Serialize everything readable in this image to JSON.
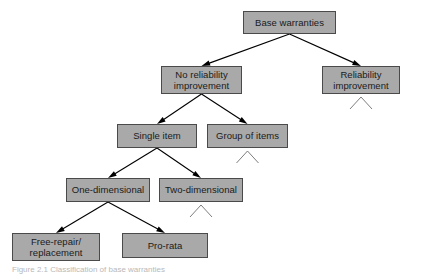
{
  "figure": {
    "type": "tree-diagram",
    "caption": "Figure 2.1  Classification of base warranties",
    "background_color": "#ffffff",
    "box_fill_color": "#a9a9a9",
    "box_border_color": "#4a4a4a",
    "connector_color": "#000000"
  },
  "nodes": [
    {
      "id": "base-warranties",
      "label": "Base warranties",
      "x": 243,
      "y": 11,
      "w": 93,
      "h": 23,
      "continuation": false
    },
    {
      "id": "no-reliability",
      "label": "No reliability\nimprovement",
      "x": 161,
      "y": 66,
      "w": 81,
      "h": 28,
      "continuation": false
    },
    {
      "id": "reliability",
      "label": "Reliability\nimprovement",
      "x": 322,
      "y": 66,
      "w": 78,
      "h": 28,
      "continuation": true
    },
    {
      "id": "single-item",
      "label": "Single item",
      "x": 117,
      "y": 124,
      "w": 80,
      "h": 24,
      "continuation": false
    },
    {
      "id": "group-of-items",
      "label": "Group of items",
      "x": 207,
      "y": 124,
      "w": 81,
      "h": 24,
      "continuation": true
    },
    {
      "id": "one-dimensional",
      "label": "One-dimensional",
      "x": 66,
      "y": 178,
      "w": 84,
      "h": 24,
      "continuation": false
    },
    {
      "id": "two-dimensional",
      "label": "Two-dimensional",
      "x": 159,
      "y": 178,
      "w": 84,
      "h": 24,
      "continuation": true
    },
    {
      "id": "free-repair",
      "label": "Free-repair/\nreplacement",
      "x": 12,
      "y": 233,
      "w": 88,
      "h": 28,
      "continuation": false
    },
    {
      "id": "pro-rata",
      "label": "Pro-rata",
      "x": 122,
      "y": 233,
      "w": 86,
      "h": 25,
      "continuation": false
    }
  ],
  "edges": [
    {
      "id": "edge-base-to-no-reliability",
      "from": "base-warranties",
      "to": "no-reliability"
    },
    {
      "id": "edge-base-to-reliability",
      "from": "base-warranties",
      "to": "reliability"
    },
    {
      "id": "edge-noreliability-to-single",
      "from": "no-reliability",
      "to": "single-item"
    },
    {
      "id": "edge-noreliability-to-group",
      "from": "no-reliability",
      "to": "group-of-items"
    },
    {
      "id": "edge-single-to-onedim",
      "from": "single-item",
      "to": "one-dimensional"
    },
    {
      "id": "edge-single-to-twodim",
      "from": "single-item",
      "to": "two-dimensional"
    },
    {
      "id": "edge-onedim-to-freerepair",
      "from": "one-dimensional",
      "to": "free-repair"
    },
    {
      "id": "edge-onedim-to-prorata",
      "from": "one-dimensional",
      "to": "pro-rata"
    }
  ]
}
